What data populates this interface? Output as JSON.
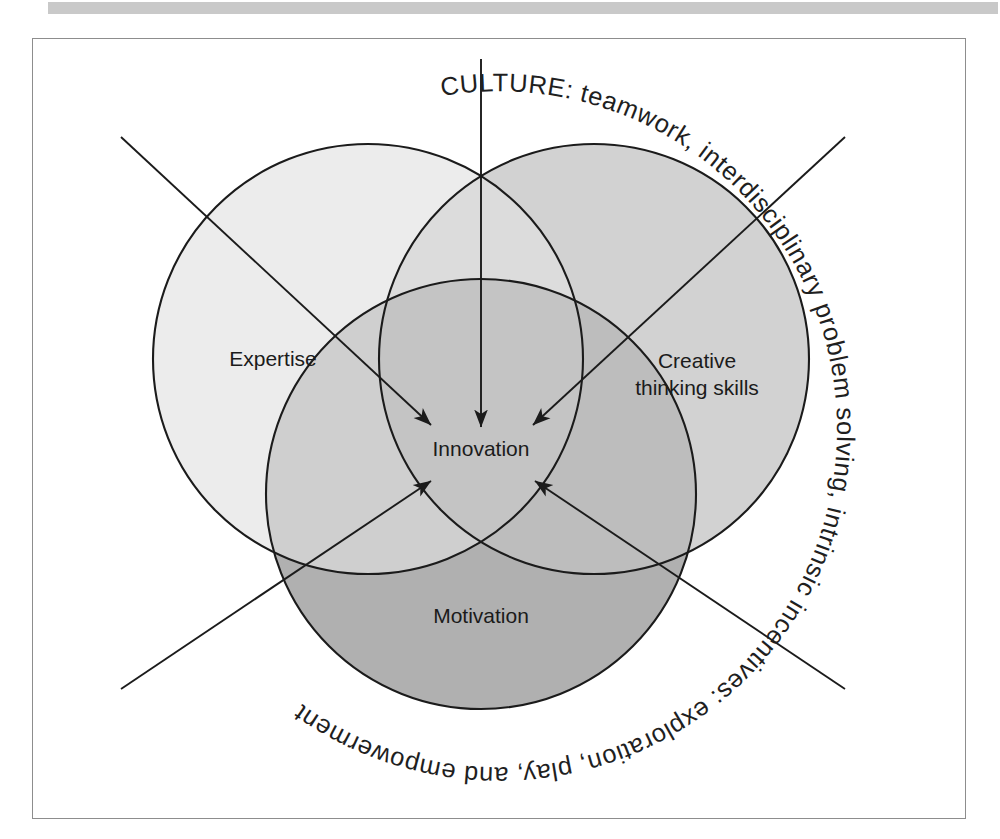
{
  "figure": {
    "type": "venn-diagram",
    "title_ring_text": "CULTURE: teamwork, interdisciplinary problem solving, intrinsic incentives: exploration, play, and empowerment",
    "center_label": "Innovation",
    "circles": [
      {
        "id": "expertise",
        "label": "Expertise",
        "fill": "#ececec"
      },
      {
        "id": "creative-thinking",
        "label": "Creative\nthinking skills",
        "label_line_1": "Creative",
        "label_line_2": "thinking skills",
        "fill": "#d2d2d2"
      },
      {
        "id": "motivation",
        "label": "Motivation",
        "fill": "#b5b5b5"
      }
    ],
    "center_fill": "#bfbfbf",
    "arrow_count": 5,
    "frame_border_color": "#8d8d8d",
    "band_color": "#c9c9c9",
    "text_color": "#1b1b1b"
  }
}
